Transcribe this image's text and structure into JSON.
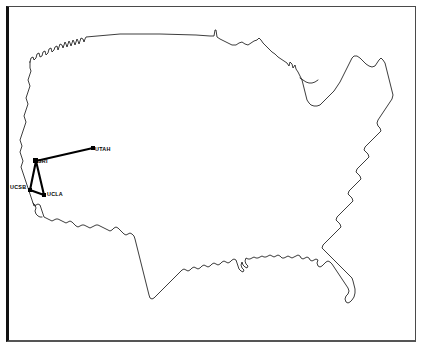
{
  "figure": {
    "background_color": "#ffffff",
    "frame_color": "#111111",
    "coastline_color": "#1a1a1a",
    "link_color": "#000000",
    "node_color": "#000000"
  },
  "map": {
    "region_name": "United States",
    "outline_style": "contiguous-us-coastline-and-border"
  },
  "network": {
    "name": "ARPANET",
    "node_count": 4,
    "link_count": 4,
    "nodes": [
      {
        "id": "sri",
        "label": "SRI",
        "x": 36,
        "y": 161,
        "label_x": 38,
        "label_y": 163,
        "label_anchor": "start"
      },
      {
        "id": "utah",
        "label": "UTAH",
        "x": 93,
        "y": 148,
        "label_x": 95,
        "label_y": 151,
        "label_anchor": "start"
      },
      {
        "id": "ucsb",
        "label": "UCSB",
        "x": 30,
        "y": 190,
        "label_x": 10,
        "label_y": 189,
        "label_anchor": "start"
      },
      {
        "id": "ucla",
        "label": "UCLA",
        "x": 44,
        "y": 195,
        "label_x": 47,
        "label_y": 196,
        "label_anchor": "start"
      }
    ],
    "links": [
      {
        "from": "sri",
        "to": "utah"
      },
      {
        "from": "sri",
        "to": "ucsb"
      },
      {
        "from": "sri",
        "to": "ucla"
      },
      {
        "from": "ucsb",
        "to": "ucla"
      }
    ]
  },
  "labels": {
    "sri": "SRI",
    "utah": "UTAH",
    "ucsb": "UCSB",
    "ucla": "UCLA"
  }
}
